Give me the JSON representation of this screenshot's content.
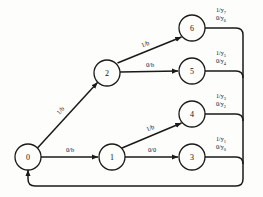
{
  "diagram": {
    "type": "state-machine",
    "stroke_color": "#1a1a1a",
    "background_color": "#fdfdfb",
    "nodes": [
      {
        "id": "n0",
        "label": "0",
        "cx": 28,
        "cy": 157,
        "r": 13
      },
      {
        "id": "n1",
        "label": "1",
        "cx": 112,
        "cy": 157,
        "r": 13
      },
      {
        "id": "n2",
        "label": "2",
        "cx": 107,
        "cy": 73,
        "r": 13
      },
      {
        "id": "n3",
        "label": "3",
        "cx": 192,
        "cy": 157,
        "r": 13
      },
      {
        "id": "n4",
        "label": "4",
        "cx": 192,
        "cy": 114,
        "r": 13
      },
      {
        "id": "n5",
        "label": "5",
        "cx": 192,
        "cy": 71,
        "r": 13
      },
      {
        "id": "n6",
        "label": "6",
        "cx": 192,
        "cy": 28,
        "r": 13
      }
    ],
    "transitions": [
      {
        "id": "e0_2",
        "from": "0",
        "to": "2",
        "label": "1/b",
        "lx": 62,
        "ly": 112
      },
      {
        "id": "e0_1",
        "from": "0",
        "to": "1",
        "label": "0/b",
        "lx": 70,
        "ly": 152
      },
      {
        "id": "e2_6",
        "from": "2",
        "to": "6",
        "label": "1/b",
        "lx": 146,
        "ly": 46
      },
      {
        "id": "e2_5",
        "from": "2",
        "to": "5",
        "label": "0/b",
        "lx": 150,
        "ly": 67
      },
      {
        "id": "e1_4",
        "from": "1",
        "to": "4",
        "label": "1/b",
        "lx": 151,
        "ly": 130
      },
      {
        "id": "e1_3",
        "from": "1",
        "to": "3",
        "label": "0/0",
        "lx": 152,
        "ly": 152
      }
    ],
    "outputs": [
      {
        "id": "o6",
        "from": "6",
        "line1": "1/y",
        "sub1": "7",
        "line2": "0/y",
        "sub2": "6",
        "lx": 221,
        "ly": 12
      },
      {
        "id": "o5",
        "from": "5",
        "line1": "1/y",
        "sub1": "5",
        "line2": "0/y",
        "sub2": "4",
        "lx": 221,
        "ly": 55
      },
      {
        "id": "o4",
        "from": "4",
        "line1": "1/y",
        "sub1": "3",
        "line2": "0/y",
        "sub2": "2",
        "lx": 221,
        "ly": 98
      },
      {
        "id": "o3",
        "from": "3",
        "line1": "1/y",
        "sub1": "1",
        "line2": "0/y",
        "sub2": "0",
        "lx": 221,
        "ly": 141
      }
    ],
    "feedback": {
      "id": "feedback-loop",
      "description": "return bus to state 0",
      "bus_x": 243,
      "bottom_y": 186,
      "target_x": 28
    }
  }
}
